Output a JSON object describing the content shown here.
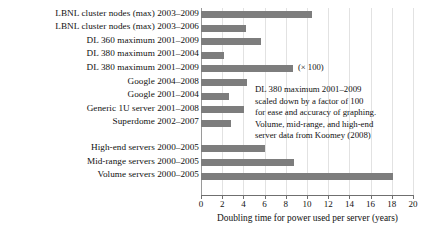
{
  "chart_data": {
    "type": "bar",
    "orientation": "horizontal",
    "title": "",
    "xlabel": "Doubling time for power used per server (years)",
    "ylabel": "",
    "xlim": [
      0,
      20
    ],
    "xticks": [
      0,
      2,
      4,
      6,
      8,
      10,
      12,
      14,
      16,
      18,
      20
    ],
    "grid": "vertical",
    "legend": "none",
    "categories": [
      "LBNL cluster nodes (max) 2003–2009",
      "LBNL cluster nodes (max) 2003–2006",
      "DL 360 maximum 2001–2009",
      "DL 380 maximum 2001–2004",
      "DL 380 maximum 2001–2009",
      "Google 2004–2008",
      "Google 2001–2004",
      "Generic 1U server 2001–2008",
      "Superdome 2002–2007",
      "High-end servers 2000–2005",
      "Mid-range servers 2000–2005",
      "Volume servers 2000–2005"
    ],
    "values": [
      10.5,
      4.2,
      5.7,
      2.2,
      8.7,
      4.3,
      2.6,
      4.1,
      2.8,
      6.0,
      8.8,
      18.1
    ],
    "group_break_after_index": 8,
    "annotations": {
      "multiplier": "(× 100)",
      "note_lines": [
        "DL 380 maximum 2001–2009",
        "scaled down by a factor of 100",
        "for ease and accuracy of graphing.",
        "Volume, mid-range, and high-end",
        "server data from Koomey (2008)"
      ]
    },
    "colors": {
      "bar": "#7d7d7d",
      "gridline": "#e2e2e2",
      "axis": "#6f6f6f",
      "text": "#111111",
      "background": "#ffffff"
    }
  }
}
